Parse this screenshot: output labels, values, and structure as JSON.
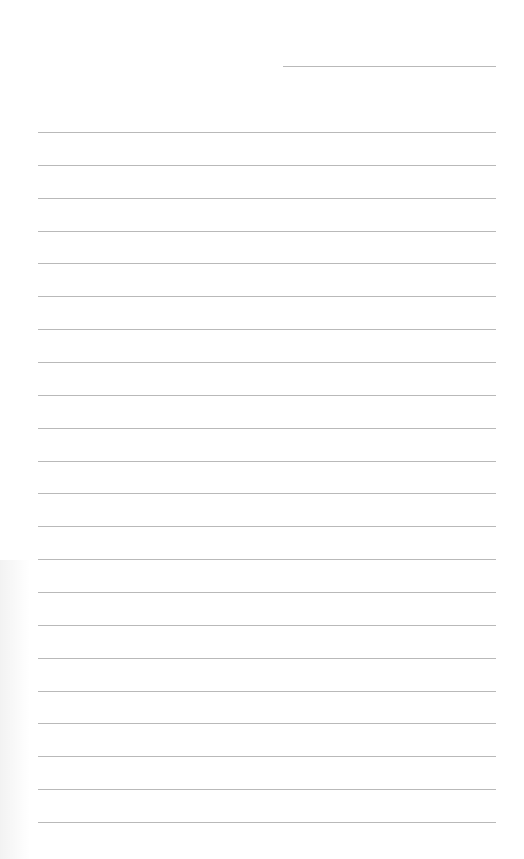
{
  "page": {
    "type": "lined-paper",
    "background_color": "#ffffff",
    "line_color": "#b9b9b9",
    "date_line": {
      "x": 283,
      "y": 66,
      "width": 213
    },
    "ruled_lines": {
      "count": 22,
      "x": 38,
      "width": 458,
      "first_y": 132,
      "spacing": 32.86
    },
    "text_content": []
  }
}
